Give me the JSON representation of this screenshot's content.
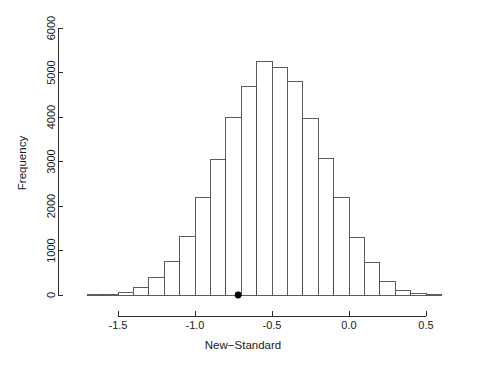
{
  "chart_data": {
    "type": "bar",
    "title": "",
    "subtitle": "",
    "xlabel": "New−Standard",
    "ylabel": "Frequency",
    "xlim": [
      -1.7,
      0.62
    ],
    "ylim": [
      0,
      6000
    ],
    "grid": false,
    "legend": null,
    "bin_width": 0.1,
    "x_ticks": [
      -1.5,
      -1.0,
      -0.5,
      0.0,
      0.5
    ],
    "x_tick_labels": [
      "-1.5",
      "-1.0",
      "-0.5",
      "0.0",
      "0.5"
    ],
    "y_ticks": [
      0,
      1000,
      2000,
      3000,
      4000,
      5000,
      6000
    ],
    "y_tick_labels": [
      "0",
      "1000",
      "2000",
      "3000",
      "4000",
      "5000",
      "6000"
    ],
    "bin_edges": [
      -1.7,
      -1.6,
      -1.5,
      -1.4,
      -1.3,
      -1.2,
      -1.1,
      -1.0,
      -0.9,
      -0.8,
      -0.7,
      -0.6,
      -0.5,
      -0.4,
      -0.3,
      -0.2,
      -0.1,
      0.0,
      0.1,
      0.2,
      0.3,
      0.4,
      0.5,
      0.6
    ],
    "categories": [
      "-1.70",
      "-1.60",
      "-1.50",
      "-1.40",
      "-1.30",
      "-1.20",
      "-1.10",
      "-1.00",
      "-0.90",
      "-0.80",
      "-0.70",
      "-0.60",
      "-0.50",
      "-0.40",
      "-0.30",
      "-0.20",
      "-0.10",
      "0.00",
      "0.10",
      "0.20",
      "0.30",
      "0.40",
      "0.50"
    ],
    "values": [
      5,
      15,
      60,
      170,
      390,
      760,
      1320,
      2180,
      3040,
      4000,
      4680,
      5250,
      5120,
      4800,
      3970,
      3070,
      2180,
      1300,
      740,
      310,
      105,
      30,
      8
    ],
    "annotations": [
      {
        "name": "observed-value-marker",
        "type": "point",
        "x": -0.72,
        "y": 0,
        "color": "#000000",
        "label": ""
      }
    ]
  },
  "axes": {
    "x_axis_name": "x-axis",
    "y_axis_name": "y-axis"
  },
  "colors": {
    "bar_fill": "#ffffff",
    "bar_stroke": "#4a4a4a",
    "axis": "#2b2b2b",
    "marker": "#000000",
    "background": "#ffffff"
  }
}
